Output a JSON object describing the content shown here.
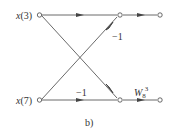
{
  "diagram": {
    "type": "butterfly-flow-graph",
    "caption": "b)",
    "inputs": [
      {
        "id": "in_top",
        "label_var": "x",
        "label_arg": "(3)"
      },
      {
        "id": "in_bottom",
        "label_var": "x",
        "label_arg": "(7)"
      }
    ],
    "edges": [
      {
        "from": "in_top",
        "to": "mid_top",
        "weight": ""
      },
      {
        "from": "in_top",
        "to": "mid_bottom",
        "weight": ""
      },
      {
        "from": "in_bottom",
        "to": "mid_top",
        "weight": "−1"
      },
      {
        "from": "in_bottom",
        "to": "mid_bottom",
        "weight": "−1"
      },
      {
        "from": "mid_top",
        "to": "out_top",
        "weight": ""
      },
      {
        "from": "mid_bottom",
        "to": "out_bottom",
        "weight": "W_8^3"
      }
    ],
    "weights": {
      "cross_label": "−1",
      "bottom_label": "−1",
      "twiddle_base": "W",
      "twiddle_sub": "8",
      "twiddle_sup": "3"
    },
    "colors": {
      "line": "#444444",
      "text": "#333333",
      "background": "#ffffff"
    }
  }
}
